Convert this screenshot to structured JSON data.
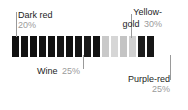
{
  "chart_data": {
    "type": "bar",
    "orientation": "horizontal-stacked",
    "title": "",
    "subtitle": "",
    "xlabel": "",
    "ylabel": "",
    "grid": false,
    "legend_position": "callouts",
    "axis_range": [
      0,
      100
    ],
    "units": "percent",
    "categories": [
      "Dark red",
      "Wine",
      "Yellow-gold",
      "Purple-red"
    ],
    "values": [
      20,
      25,
      30,
      25
    ],
    "series": [
      {
        "name": "Color share",
        "values": [
          20,
          25,
          30,
          25
        ]
      }
    ],
    "annotations": [
      {
        "label": "Dark red",
        "percent": "20%",
        "value": 20,
        "position": "above-left"
      },
      {
        "label": "Wine",
        "percent": "25%",
        "value": 25,
        "position": "below-left"
      },
      {
        "label": "Yellow-gold",
        "percent": "30%",
        "value": 30,
        "position": "above-right"
      },
      {
        "label": "Purple-red",
        "percent": "25%",
        "value": 25,
        "position": "below-right"
      }
    ]
  },
  "callouts": {
    "dark_red": {
      "label": "Dark red",
      "percent": "20%"
    },
    "wine": {
      "label": "Wine",
      "percent": "25%"
    },
    "yellow_gold": {
      "label_line1": "Yellow-",
      "label_line2": "gold",
      "percent": "30%"
    },
    "purple_red": {
      "label": "Purple-red",
      "percent": "25%"
    }
  },
  "bar": {
    "segments": [
      {
        "name": "dark-red-stripe-1",
        "color": "#111111",
        "width": 7
      },
      {
        "name": "gap-1",
        "color": "#ffffff",
        "width": 2
      },
      {
        "name": "dark-red-stripe-2",
        "color": "#131313",
        "width": 7
      },
      {
        "name": "gap-2",
        "color": "#ffffff",
        "width": 2
      },
      {
        "name": "dark-red-stripe-3",
        "color": "#101010",
        "width": 7
      },
      {
        "name": "gap-3",
        "color": "#ffffff",
        "width": 2
      },
      {
        "name": "dark-red-stripe-4",
        "color": "#141414",
        "width": 7
      },
      {
        "name": "gap-4",
        "color": "#ffffff",
        "width": 2
      },
      {
        "name": "wine-stripe-1",
        "color": "#121212",
        "width": 7
      },
      {
        "name": "gap-5",
        "color": "#ffffff",
        "width": 2
      },
      {
        "name": "wine-stripe-2",
        "color": "#171717",
        "width": 7
      },
      {
        "name": "gap-6",
        "color": "#ffffff",
        "width": 2
      },
      {
        "name": "wine-stripe-3",
        "color": "#111111",
        "width": 7
      },
      {
        "name": "gap-7",
        "color": "#ffffff",
        "width": 2
      },
      {
        "name": "wine-stripe-4",
        "color": "#151515",
        "width": 7
      },
      {
        "name": "gap-8",
        "color": "#ffffff",
        "width": 2
      },
      {
        "name": "wine-stripe-5",
        "color": "#1a1a1a",
        "width": 7
      },
      {
        "name": "gap-9",
        "color": "#ffffff",
        "width": 2
      },
      {
        "name": "wine-stripe-6",
        "color": "#131313",
        "width": 7
      },
      {
        "name": "gap-10",
        "color": "#ffffff",
        "width": 2
      },
      {
        "name": "yellow-gold-stripe-1",
        "color": "#c9c9c9",
        "width": 7
      },
      {
        "name": "gap-11",
        "color": "#ffffff",
        "width": 2
      },
      {
        "name": "yellow-gold-stripe-2",
        "color": "#d6d6d6",
        "width": 7
      },
      {
        "name": "gap-12",
        "color": "#ffffff",
        "width": 2
      },
      {
        "name": "yellow-gold-stripe-3",
        "color": "#c4c4c4",
        "width": 7
      },
      {
        "name": "gap-13",
        "color": "#ffffff",
        "width": 2
      },
      {
        "name": "yellow-gold-stripe-4",
        "color": "#d0d0d0",
        "width": 7
      },
      {
        "name": "gap-14",
        "color": "#ffffff",
        "width": 2
      },
      {
        "name": "purple-red-stripe-1",
        "color": "#1c1c1c",
        "width": 7
      },
      {
        "name": "gap-15",
        "color": "#ffffff",
        "width": 2
      },
      {
        "name": "purple-red-stripe-2",
        "color": "#161616",
        "width": 7
      }
    ]
  },
  "leaders": [
    {
      "name": "leader-dark-red",
      "left": 16,
      "top": 12,
      "height": 25,
      "color": "#9a9a9a"
    },
    {
      "name": "leader-wine",
      "left": 83,
      "top": 55,
      "height": 14,
      "color": "#9a9a9a"
    },
    {
      "name": "leader-yellow-gold",
      "left": 131,
      "top": 14,
      "height": 24,
      "color": "#9a9a9a"
    },
    {
      "name": "leader-purple-red",
      "left": 170,
      "top": 55,
      "height": 25,
      "color": "#9a9a9a"
    }
  ],
  "colors": {
    "text": "#1d1d1d",
    "muted_text": "#9b9b9b",
    "leader": "#9a9a9a",
    "background": "#ffffff",
    "dark_stripe": "#121212",
    "light_stripe": "#cdcdcd"
  }
}
